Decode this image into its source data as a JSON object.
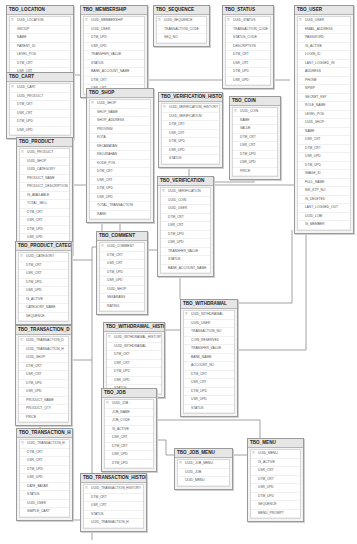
{
  "diagram": {
    "tables": [
      {
        "id": "location",
        "name": "TBO_LOCATION",
        "x": 6,
        "y": 5,
        "w": 66,
        "columns": [
          "UUID_LOCATION",
          "GROUP",
          "NAME",
          "PARENT_ID",
          "LEVEL_POS",
          "DTM_CRT",
          "USR_CRT"
        ]
      },
      {
        "id": "membership",
        "name": "TBO_MEMBERSHIP",
        "x": 80,
        "y": 5,
        "w": 66,
        "columns": [
          "UUID_MEMBERSHIP",
          "UUID_USER",
          "DTM_UPD",
          "USR_UPD",
          "TRANSFER_VALUE",
          "STATUS",
          "BANK_ACCOUNT_NAME",
          "DTM_CRT",
          "USR_CRT"
        ]
      },
      {
        "id": "sequence",
        "name": "TBO_SEQUENCE",
        "x": 153,
        "y": 5,
        "w": 55,
        "columns": [
          "UUID_SEQUENCE",
          "TRANSACTION_CODE",
          "SEQ_NO"
        ]
      },
      {
        "id": "status",
        "name": "TBO_STATUS",
        "x": 222,
        "y": 5,
        "w": 50,
        "columns": [
          "UUID_STATUS",
          "TRANSACTION_CODE",
          "STATUS_CODE",
          "DESCRIPTION",
          "DTM_CRT",
          "USR_CRT",
          "DTM_UPD",
          "USR_UPD"
        ]
      },
      {
        "id": "user",
        "name": "TBO_USER",
        "x": 294,
        "y": 5,
        "w": 58,
        "columns": [
          "UUID_USER",
          "EMAIL_ADDRESS",
          "PASSWORD",
          "IS_ACTIVE",
          "LOGIN_ID",
          "LAST_LOGGED_IN",
          "ADDRESS",
          "PHONE",
          "NPWP",
          "SECRET_KEY",
          "ROLE_NAME",
          "LEVEL_POS",
          "UUID_SHOP",
          "NAME",
          "USR_CRT",
          "DTM_CRT",
          "USR_UPD",
          "DTM_UPD",
          "IMAGE_ID",
          "FULL_NAME",
          "NIK_KTP_NO",
          "IS_DELETED",
          "LAST_LOGGED_OUT",
          "UUID_LOBI",
          "IS_MEMBER"
        ]
      },
      {
        "id": "cart",
        "name": "TBO_CART",
        "x": 6,
        "y": 72,
        "w": 66,
        "columns": [
          "UUID_CART",
          "UUID_PRODUCT",
          "DTM_CRT",
          "USR_CRT",
          "DTM_UPD",
          "USR_UPD"
        ]
      },
      {
        "id": "shop",
        "name": "TBO_SHOP",
        "x": 86,
        "y": 88,
        "w": 66,
        "columns": [
          "UUID_SHOP",
          "SHOP_NAME",
          "SHOP_ADDRESS",
          "PROVINSI",
          "KOTA",
          "KECAMATAN",
          "KELURAHAN",
          "KODE_POS",
          "DTM_CRT",
          "USR_CRT",
          "DTM_UPD",
          "USR_UPD",
          "TOTAL_TRANSACTION",
          "RANK"
        ]
      },
      {
        "id": "verif_hist",
        "name": "TBO_VERIFICATION_HISTORY",
        "x": 158,
        "y": 92,
        "w": 63,
        "columns": [
          "UUID_VERIFICATION_HISTORY",
          "UUID_VERIFICATION",
          "DTM_CRT",
          "USR_CRT",
          "DTM_UPD",
          "USR_UPD",
          "STATUS"
        ]
      },
      {
        "id": "coin",
        "name": "TBO_COIN",
        "x": 229,
        "y": 96,
        "w": 50,
        "columns": [
          "UUID_COIN",
          "NAME",
          "VALUE",
          "DTM_CRT",
          "USR_CRT",
          "DTM_UPD",
          "USR_UPD",
          "PRICE"
        ]
      },
      {
        "id": "product",
        "name": "TBO_PRODUCT",
        "x": 16,
        "y": 137,
        "w": 55,
        "columns": [
          "UUID_PRODUCT",
          "UUID_SHOP",
          "UUID_CATEGORY",
          "PRODUCT_NAME",
          "PRODUCT_DESCRIPTION",
          "IS_AVAILABLE",
          "TOTAL_SELL",
          "DTM_CRT",
          "USR_CRT",
          "DTM_UPD",
          "USR_UPD",
          "DISC"
        ]
      },
      {
        "id": "verification",
        "name": "TBO_VERIFICATION",
        "x": 157,
        "y": 176,
        "w": 55,
        "columns": [
          "UUID_VERIFICATION",
          "UUID_COIN",
          "UUID_USER",
          "DTM_CRT",
          "USR_CRT",
          "DTM_UPD",
          "USR_UPD",
          "TRANSFER_VALUE",
          "STATUS",
          "BANK_ACCOUNT_NAME"
        ]
      },
      {
        "id": "comment",
        "name": "TBO_COMMENT",
        "x": 96,
        "y": 231,
        "w": 50,
        "columns": [
          "UUID_COMMENT",
          "DTM_CRT",
          "USR_CRT",
          "DTM_UPD",
          "USR_UPD",
          "UUID_SHOP",
          "SEKARANG",
          "RATING"
        ]
      },
      {
        "id": "prod_cat",
        "name": "TBO_PRODUCT_CATEGORY",
        "x": 15,
        "y": 241,
        "w": 55,
        "columns": [
          "UUID_CATEGORY",
          "DTM_CRT",
          "USR_CRT",
          "DTM_UPD",
          "USR_UPD",
          "IS_ACTIVE",
          "CATEGORY_NAME",
          "SEQUENCE"
        ]
      },
      {
        "id": "withdrawal",
        "name": "TBO_WITHDRAWAL",
        "x": 180,
        "y": 299,
        "w": 56,
        "columns": [
          "UUID_WITHDRAWAL",
          "UUID_USER",
          "TRANSACTION_NO",
          "COIN_RESERVED",
          "TRANSFER_VALUE",
          "BANK_NAME",
          "ACCOUNT_NO",
          "DTM_CRT",
          "USR_CRT",
          "DTM_UPD",
          "USR_UPD",
          "STATUS"
        ]
      },
      {
        "id": "withdrawal_hist",
        "name": "TBO_WITHDRAWAL_HISTORY",
        "x": 103,
        "y": 322,
        "w": 60,
        "columns": [
          "UUID_WITHDRAWAL_HISTORY",
          "UUID_WITHDRAWAL",
          "DTM_CRT",
          "USR_CRT",
          "DTM_UPD",
          "USR_UPD",
          "STATUS"
        ]
      },
      {
        "id": "trans_d",
        "name": "TBO_TRANSACTION_D",
        "x": 15,
        "y": 325,
        "w": 55,
        "columns": [
          "UUID_TRANSACTION_D",
          "UUID_TRANSACTION_H",
          "UUID_SHOP",
          "DTM_CRT",
          "USR_CRT",
          "DTM_UPD",
          "USR_UPD",
          "PRODUCT_NAME",
          "PRODUCT_QTY",
          "PRICE"
        ]
      },
      {
        "id": "job",
        "name": "TBO_JOB",
        "x": 101,
        "y": 388,
        "w": 54,
        "columns": [
          "UUID_JOB",
          "JOB_NAME",
          "JOB_CODE",
          "IS_ACTIVE",
          "USR_CRT",
          "DTM_CRT",
          "USR_UPD",
          "DTM_UPD"
        ]
      },
      {
        "id": "trans_h",
        "name": "TBO_TRANSACTION_H",
        "x": 16,
        "y": 428,
        "w": 55,
        "columns": [
          "UUID_TRANSACTION_H",
          "DTM_CRT",
          "USR_CRT",
          "DTM_UPD",
          "USR_UPD",
          "DATE_BAYAR",
          "STATUS",
          "UUID_USER",
          "SIMPLE_CART"
        ]
      },
      {
        "id": "job_menu",
        "name": "TBO_JOB_MENU",
        "x": 174,
        "y": 448,
        "w": 57,
        "columns": [
          "UUID_JOB_MENU",
          "UUID_JOB",
          "UUID_MENU"
        ]
      },
      {
        "id": "menu",
        "name": "TBO_MENU",
        "x": 247,
        "y": 438,
        "w": 55,
        "columns": [
          "UUID_MENU",
          "IS_ACTIVE",
          "USR_CRT",
          "DTM_CRT",
          "USR_UPD",
          "DTM_UPD",
          "SEQUENCE",
          "MENU_PROMPT"
        ]
      },
      {
        "id": "trans_hist",
        "name": "TBO_TRANSACTION_HISTORY",
        "x": 80,
        "y": 473,
        "w": 65,
        "columns": [
          "UUID_TRANSACTION_HISTORY",
          "DTM_CRT",
          "USR_CRT",
          "STATUS",
          "UUID_TRANSACTION_H"
        ]
      }
    ],
    "colors": {
      "line": "#8a8a8a",
      "header": "#e6e6e6",
      "border": "#9a9a9a",
      "background": "#ffffff"
    }
  }
}
